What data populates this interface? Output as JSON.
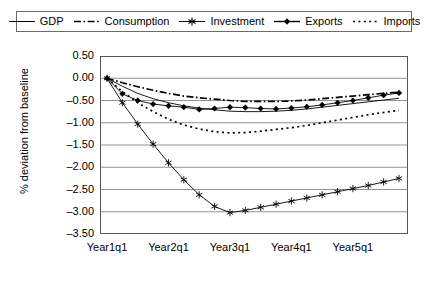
{
  "chart_data": {
    "type": "line",
    "title": "",
    "xlabel": "",
    "ylabel": "% deviation from baseline",
    "ylim": [
      -3.5,
      0.5
    ],
    "ytick_labels": [
      "0.50",
      "0.00",
      "-0.50",
      "-1.00",
      "-1.50",
      "-2.00",
      "-2.50",
      "-3.00",
      "-3.50"
    ],
    "ytick_values": [
      0.5,
      0.0,
      -0.5,
      -1.0,
      -1.5,
      -2.0,
      -2.5,
      -3.0,
      -3.5
    ],
    "xtick_labels": [
      "Year1q1",
      "Year2q1",
      "Year3q1",
      "Year4q1",
      "Year5q1"
    ],
    "xtick_positions": [
      0,
      4,
      8,
      12,
      16
    ],
    "x": [
      0,
      1,
      2,
      3,
      4,
      5,
      6,
      7,
      8,
      9,
      10,
      11,
      12,
      13,
      14,
      15,
      16,
      17,
      18,
      19
    ],
    "grid": true,
    "legend_position": "top",
    "series": [
      {
        "name": "GDP",
        "style": "solid",
        "marker": "none",
        "color": "#000000",
        "values": [
          0.0,
          -0.18,
          -0.34,
          -0.46,
          -0.55,
          -0.62,
          -0.67,
          -0.71,
          -0.74,
          -0.75,
          -0.75,
          -0.74,
          -0.72,
          -0.69,
          -0.65,
          -0.61,
          -0.57,
          -0.53,
          -0.49,
          -0.45
        ]
      },
      {
        "name": "Consumption",
        "style": "dash-dot",
        "marker": "none",
        "color": "#000000",
        "values": [
          0.0,
          -0.1,
          -0.19,
          -0.27,
          -0.34,
          -0.4,
          -0.44,
          -0.47,
          -0.5,
          -0.52,
          -0.52,
          -0.52,
          -0.51,
          -0.49,
          -0.46,
          -0.43,
          -0.4,
          -0.37,
          -0.34,
          -0.31
        ]
      },
      {
        "name": "Investment",
        "style": "solid",
        "marker": "asterisk",
        "color": "#000000",
        "values": [
          0.0,
          -0.55,
          -1.03,
          -1.48,
          -1.9,
          -2.28,
          -2.62,
          -2.88,
          -3.02,
          -2.97,
          -2.9,
          -2.83,
          -2.76,
          -2.69,
          -2.62,
          -2.55,
          -2.48,
          -2.41,
          -2.33,
          -2.25
        ]
      },
      {
        "name": "Exports",
        "style": "solid",
        "marker": "diamond",
        "color": "#000000",
        "values": [
          0.0,
          -0.35,
          -0.5,
          -0.58,
          -0.62,
          -0.65,
          -0.7,
          -0.68,
          -0.65,
          -0.66,
          -0.68,
          -0.69,
          -0.67,
          -0.64,
          -0.6,
          -0.55,
          -0.5,
          -0.44,
          -0.38,
          -0.33
        ]
      },
      {
        "name": "Imports",
        "style": "dotted",
        "marker": "none",
        "color": "#000000",
        "values": [
          0.0,
          -0.3,
          -0.55,
          -0.75,
          -0.92,
          -1.05,
          -1.14,
          -1.2,
          -1.23,
          -1.22,
          -1.19,
          -1.15,
          -1.11,
          -1.06,
          -1.0,
          -0.94,
          -0.88,
          -0.82,
          -0.77,
          -0.72
        ]
      }
    ]
  },
  "legend": {
    "items": [
      {
        "label": "GDP",
        "swatch": "solid-line-swatch"
      },
      {
        "label": "Consumption",
        "swatch": "dash-dot-line-swatch"
      },
      {
        "label": "Investment",
        "swatch": "asterisk-marker-swatch"
      },
      {
        "label": "Exports",
        "swatch": "diamond-marker-swatch"
      },
      {
        "label": "Imports",
        "swatch": "dotted-line-swatch"
      }
    ]
  }
}
